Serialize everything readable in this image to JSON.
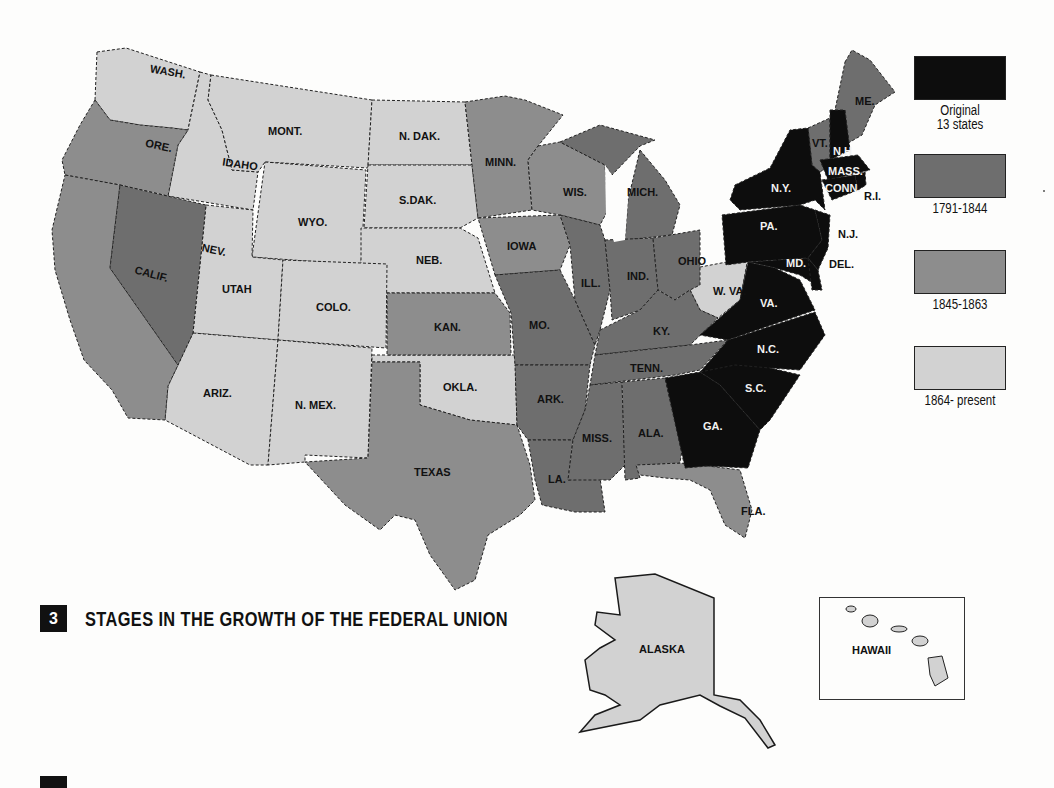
{
  "figure": {
    "number": "3",
    "title": "STAGES IN THE GROWTH OF THE FEDERAL UNION"
  },
  "legend": {
    "items": [
      {
        "label_line1": "Original",
        "label_line2": "13 states",
        "color": "#0d0d0d"
      },
      {
        "label_line1": "1791-1844",
        "label_line2": "",
        "color": "#6e6e6e"
      },
      {
        "label_line1": "1845-1863",
        "label_line2": "",
        "color": "#8d8d8d"
      },
      {
        "label_line1": "1864- present",
        "label_line2": "",
        "color": "#d2d2d2"
      }
    ]
  },
  "states": {
    "wash": "WASH.",
    "ore": "ORE.",
    "calif": "CALIF.",
    "idaho": "IDAHO",
    "nev": "NEV.",
    "mont": "MONT.",
    "wyo": "WYO.",
    "utah": "UTAH",
    "colo": "COLO.",
    "ariz": "ARIZ.",
    "nmex": "N. MEX.",
    "ndak": "N. DAK.",
    "sdak": "S.DAK.",
    "neb": "NEB.",
    "kan": "KAN.",
    "okla": "OKLA.",
    "texas": "TEXAS",
    "minn": "MINN.",
    "iowa": "IOWA",
    "mo": "MO.",
    "ark": "ARK.",
    "la": "LA.",
    "wis": "WIS.",
    "ill": "ILL.",
    "mich": "MICH.",
    "ind": "IND.",
    "ohio": "OHIO",
    "ky": "KY.",
    "tenn": "TENN.",
    "miss": "MISS.",
    "ala": "ALA.",
    "fla": "FLA.",
    "ga": "GA.",
    "sc": "S.C.",
    "nc": "N.C.",
    "va": "VA.",
    "wva": "W. VA.",
    "md": "MD.",
    "del": "DEL.",
    "nj": "N.J.",
    "pa": "PA.",
    "ny": "N.Y.",
    "vt": "VT.",
    "nh": "N.H",
    "me": "ME.",
    "mass": "MASS.",
    "conn": "CONN.",
    "ri": "R.I.",
    "alaska": "ALASKA",
    "hawaii": "HAWAII"
  }
}
